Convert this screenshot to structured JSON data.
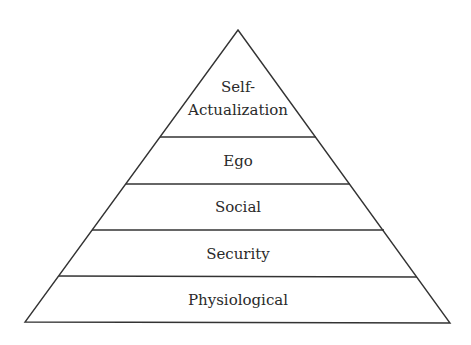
{
  "diagram": {
    "type": "pyramid",
    "levels": [
      {
        "label_line1": "Self-",
        "label_line2": "Actualization"
      },
      {
        "label": "Ego"
      },
      {
        "label": "Social"
      },
      {
        "label": "Security"
      },
      {
        "label": "Physiological"
      }
    ],
    "colors": {
      "stroke": "#333333",
      "text": "#2a2a2a",
      "background": "#ffffff"
    }
  }
}
